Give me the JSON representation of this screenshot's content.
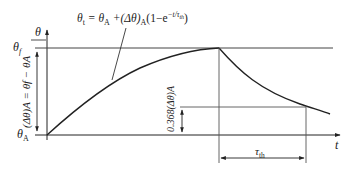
{
  "diagram": {
    "type": "temperature-rise-curve",
    "formula": {
      "lhs": "θ",
      "lhs_sub": "t",
      "rhs": " = θ",
      "rhs_sub1": "A",
      "rhs_mid": " +(Δθ)",
      "rhs_sub2": "A",
      "rhs_end": "(1−e",
      "exp": "−t/τ",
      "exp_sub": "th",
      "close": ")"
    },
    "y_axis_label": "θ",
    "x_axis_label": "t",
    "labels": {
      "theta_f": "θ",
      "theta_f_sub": "f",
      "theta_A": "θ",
      "theta_A_sub": "A",
      "delta_vertical": "(Δθ)A = θf − θA",
      "decay_fraction": "0.368(Δθ)A",
      "time_constant": "τ",
      "time_constant_sub": "th"
    },
    "colors": {
      "stroke": "#222222",
      "light_stroke": "#555555",
      "background": "#ffffff"
    }
  }
}
